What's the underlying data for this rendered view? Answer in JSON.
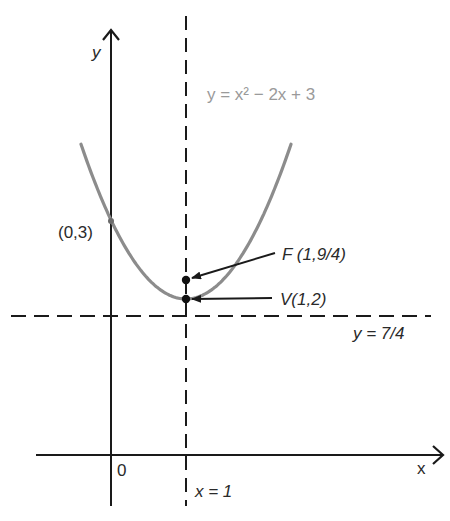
{
  "figure": {
    "type": "parabola-focus-directrix",
    "equation_label": "y = x² − 2x + 3",
    "axes": {
      "x_label": "x",
      "y_label": "y",
      "origin_label": "0"
    },
    "points": {
      "y_intercept": {
        "label": "(0,3)",
        "x": 0,
        "y": 3
      },
      "focus": {
        "label": "F (1,9/4)",
        "x": 1,
        "y": 2.25
      },
      "vertex": {
        "label": "V(1,2)",
        "x": 1,
        "y": 2
      }
    },
    "lines": {
      "axis_of_symmetry": {
        "label": "x = 1",
        "x": 1,
        "style": "dashed"
      },
      "directrix": {
        "label": "y = 7/4",
        "y": 1.75,
        "style": "dashed"
      }
    },
    "colors": {
      "axes": "#1a1a1a",
      "curve": "#8c8c8c",
      "equation_label": "#9a9a9a",
      "text": "#2a2a2a"
    }
  }
}
